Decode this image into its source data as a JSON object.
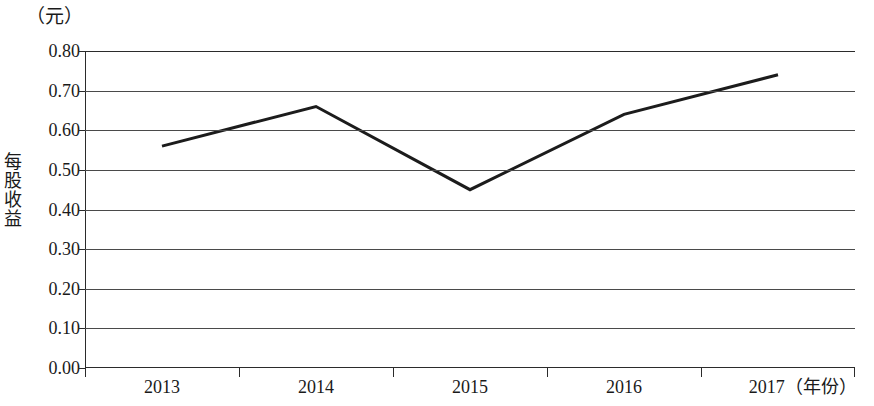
{
  "chart_data": {
    "type": "line",
    "title": "",
    "subtitle": "",
    "xlabel": "（年份）",
    "ylabel": "每股收益",
    "y_unit_label": "（元）",
    "categories": [
      "2013",
      "2014",
      "2015",
      "2016",
      "2017"
    ],
    "values": [
      0.56,
      0.66,
      0.45,
      0.64,
      0.74
    ],
    "series": [
      {
        "name": "每股收益",
        "values": [
          0.56,
          0.66,
          0.45,
          0.64,
          0.74
        ]
      }
    ],
    "ylim": [
      0.0,
      0.8
    ],
    "ytick_step": 0.1,
    "ytick_labels": [
      "0.80",
      "0.70",
      "0.60",
      "0.50",
      "0.40",
      "0.30",
      "0.20",
      "0.10",
      "0.00"
    ],
    "ytick_values": [
      0.8,
      0.7,
      0.6,
      0.5,
      0.4,
      0.3,
      0.2,
      0.1,
      0.0
    ],
    "xtick_labels": [
      "2013",
      "2014",
      "2015",
      "2016",
      "2017"
    ],
    "grid": true,
    "grid_axis": "y",
    "legend": false,
    "legend_position": "none",
    "line_color": "#1c1c1c",
    "grid_color": "#4a4a4a",
    "axis_color": "#2b2b2b",
    "background_color": "#ffffff",
    "markers": false,
    "annotations": []
  },
  "axis": {
    "x_unit_suffix": "（年份）",
    "y_unit_top": "（元）"
  }
}
